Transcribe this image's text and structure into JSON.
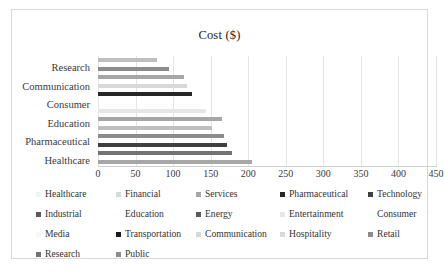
{
  "chart_data": {
    "type": "bar",
    "orientation": "horizontal",
    "title": "Cost ($)",
    "xlabel": "",
    "ylabel": "",
    "xlim": [
      0,
      450
    ],
    "xticks": [
      0,
      50,
      100,
      150,
      200,
      250,
      300,
      350,
      400,
      450
    ],
    "grid": true,
    "legend_position": "bottom",
    "categories": [
      "Healthcare",
      "Financial",
      "Services",
      "Pharmaceutical",
      "Technology",
      "Industrial",
      "Education",
      "Energy",
      "Entertainment",
      "Consumer",
      "Media",
      "Transportation",
      "Communication",
      "Hospitality",
      "Retail",
      "Research",
      "Public"
    ],
    "values": [
      205,
      179,
      172,
      168,
      152,
      165,
      144,
      0,
      125,
      118,
      114,
      95,
      78,
      0,
      0,
      0,
      0
    ],
    "series": [
      {
        "name": "Cost ($)",
        "values": [
          205,
          179,
          172,
          168,
          152,
          165,
          144,
          0,
          125,
          118,
          114,
          95,
          78,
          0,
          0,
          0,
          0
        ]
      }
    ],
    "bars_top_to_bottom": [
      {
        "label": "Communication",
        "value": 78,
        "color": "#bfbfbf"
      },
      {
        "label": "Retail",
        "value": 95,
        "color": "#8c8c8c"
      },
      {
        "label": "Research",
        "value": 114,
        "color": "#a6a6a6"
      },
      {
        "label": "Hospitality",
        "value": 118,
        "color": "#d9d9d9"
      },
      {
        "label": "Transportation",
        "value": 125,
        "color": "#262626"
      },
      {
        "label": "Media",
        "value": 0,
        "color": "#f2f2f2"
      },
      {
        "label": "Consumer",
        "value": 144,
        "color": "#e6e6e6"
      },
      {
        "label": "Entertainment",
        "value": 165,
        "color": "#a6a6a6"
      },
      {
        "label": "Energy",
        "value": 152,
        "color": "#bfbfbf"
      },
      {
        "label": "Education",
        "value": 168,
        "color": "#8c8c8c"
      },
      {
        "label": "Industrial",
        "value": 172,
        "color": "#404040"
      },
      {
        "label": "Technology",
        "value": 179,
        "color": "#737373"
      },
      {
        "label": "Pharmaceutical",
        "value": 205,
        "color": "#a6a6a6"
      }
    ],
    "visible_category_labels": [
      "Research",
      "Communication",
      "Consumer",
      "Education",
      "Pharmaceutical",
      "Healthcare"
    ],
    "legend": [
      {
        "label": "Healthcare",
        "color": "#f2f2f2"
      },
      {
        "label": "Financial",
        "color": "#d9d9d9"
      },
      {
        "label": "Services",
        "color": "#a6a6a6"
      },
      {
        "label": "Pharmaceutical",
        "color": "#262626"
      },
      {
        "label": "Technology",
        "color": "#404040"
      },
      {
        "label": "Industrial",
        "color": "#595959"
      },
      {
        "label": "Education",
        "color": "#ffffff"
      },
      {
        "label": "Energy",
        "color": "#595959"
      },
      {
        "label": "Entertainment",
        "color": "#e6e6e6"
      },
      {
        "label": "Consumer",
        "color": "#ffffff"
      },
      {
        "label": "Media",
        "color": "#f7f7f7"
      },
      {
        "label": "Transportation",
        "color": "#1a1a1a"
      },
      {
        "label": "Communication",
        "color": "#d9d9d9"
      },
      {
        "label": "Hospitality",
        "color": "#d9d9d9"
      },
      {
        "label": "Retail",
        "color": "#8c8c8c"
      },
      {
        "label": "Research",
        "color": "#737373"
      },
      {
        "label": "Public",
        "color": "#8c8c8c"
      }
    ]
  }
}
